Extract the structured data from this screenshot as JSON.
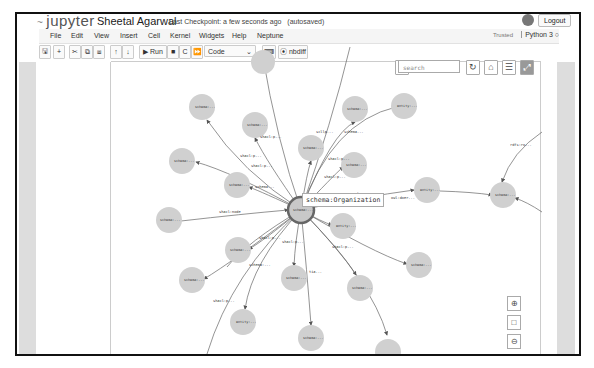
{
  "header": {
    "logo": "jupyter",
    "notebook_title": "Sheetal Agarwal",
    "checkpoint": "Last Checkpoint: a few seconds ago",
    "autosave": "(autosaved)",
    "logout_label": "Logout"
  },
  "menubar": {
    "items": [
      "File",
      "Edit",
      "View",
      "Insert",
      "Cell",
      "Kernel",
      "Widgets",
      "Help",
      "Neptune"
    ],
    "trusted": "Trusted",
    "kernel": "Python 3"
  },
  "toolbar": {
    "save_icon": "💾",
    "add_icon": "+",
    "cut_icon": "✂",
    "copy_icon": "⧉",
    "paste_icon": "⧈",
    "move_up_icon": "↑",
    "move_down_icon": "↓",
    "run_label": "▶ Run",
    "stop_icon": "■",
    "restart_icon": "C",
    "fast_forward_icon": "⏩",
    "cell_type": "Code",
    "keyboard_icon": "⌨",
    "nbdiff_label": "⦿ nbdiff"
  },
  "graph_view": {
    "search_placeholder": "search",
    "tooltip": "schema:Organization",
    "center_label": "schema:...",
    "nodes": [
      {
        "label": "schema:...",
        "x": 200,
        "y": 105
      },
      {
        "label": "schema:...",
        "x": 253,
        "y": 123
      },
      {
        "label": "schema:...",
        "x": 353,
        "y": 107
      },
      {
        "label": "entity:...",
        "x": 402,
        "y": 104
      },
      {
        "label": "schema:...",
        "x": 309,
        "y": 146
      },
      {
        "label": "schema:...",
        "x": 180,
        "y": 159
      },
      {
        "label": "schema:...",
        "x": 235,
        "y": 183
      },
      {
        "label": "schema:...",
        "x": 352,
        "y": 163
      },
      {
        "label": "entity:...",
        "x": 425,
        "y": 188
      },
      {
        "label": "schema:...",
        "x": 501,
        "y": 193
      },
      {
        "label": "schema:...",
        "x": 167,
        "y": 218
      },
      {
        "label": "entity:...",
        "x": 341,
        "y": 224
      },
      {
        "label": "schema:...",
        "x": 236,
        "y": 248
      },
      {
        "label": "schema:...",
        "x": 190,
        "y": 278
      },
      {
        "label": "schema:...",
        "x": 292,
        "y": 276
      },
      {
        "label": "schema:...",
        "x": 417,
        "y": 263
      },
      {
        "label": "schema:...",
        "x": 358,
        "y": 286
      },
      {
        "label": "entity:...",
        "x": 241,
        "y": 320
      },
      {
        "label": "schema:...",
        "x": 309,
        "y": 336
      },
      {
        "label": "schema:...",
        "x": 386,
        "y": 346
      }
    ],
    "edge_labels": [
      {
        "text": "shacl:p...",
        "x": 258,
        "y": 136
      },
      {
        "text": "scllp...",
        "x": 314,
        "y": 131
      },
      {
        "text": "schema...",
        "x": 342,
        "y": 131
      },
      {
        "text": "shacl:p...",
        "x": 238,
        "y": 155
      },
      {
        "text": "shacl:p...",
        "x": 249,
        "y": 165
      },
      {
        "text": "shacl:p...",
        "x": 326,
        "y": 158
      },
      {
        "text": "shacl:p...",
        "x": 322,
        "y": 176
      },
      {
        "text": "schema...",
        "x": 253,
        "y": 186
      },
      {
        "text": "shacl:node",
        "x": 217,
        "y": 211
      },
      {
        "text": "schema:...",
        "x": 351,
        "y": 193
      },
      {
        "text": "owl:doer...",
        "x": 389,
        "y": 197
      },
      {
        "text": "rdfs:ro...",
        "x": 508,
        "y": 144
      },
      {
        "text": "shacl:p...",
        "x": 257,
        "y": 237
      },
      {
        "text": "shacl:p...",
        "x": 280,
        "y": 241
      },
      {
        "text": "shacl:p...",
        "x": 330,
        "y": 246
      },
      {
        "text": "schema:...",
        "x": 247,
        "y": 264
      },
      {
        "text": "tia...",
        "x": 307,
        "y": 271
      },
      {
        "text": "shacl:p...",
        "x": 211,
        "y": 300
      }
    ],
    "controls": {
      "select_user_icon": "user-check",
      "refresh_icon": "↻",
      "lock_icon": "🔓",
      "list_icon": "☰",
      "fullscreen_icon": "⤢",
      "zoom_in_icon": "⊕",
      "fit_icon": "□",
      "zoom_out_icon": "⊖"
    }
  }
}
